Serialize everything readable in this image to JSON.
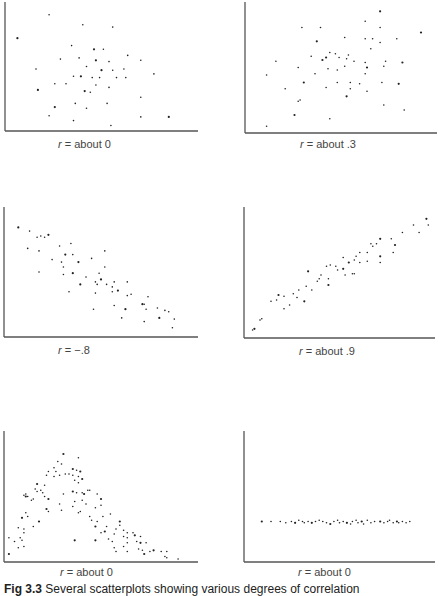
{
  "caption": {
    "fig_label": "Fig 3.3",
    "text": "Several scatterplots showing various degrees of correlation"
  },
  "chart_data": [
    {
      "type": "scatter",
      "id": "p1",
      "label_var": "r",
      "label_rest": " = about 0",
      "xlim": [
        0,
        100
      ],
      "ylim": [
        0,
        100
      ],
      "grid": false,
      "points": [
        [
          5,
          73
        ],
        [
          22,
          92
        ],
        [
          40,
          84
        ],
        [
          56,
          82
        ],
        [
          34,
          67
        ],
        [
          46,
          64
        ],
        [
          51,
          64
        ],
        [
          64,
          59
        ],
        [
          28,
          56
        ],
        [
          38,
          57
        ],
        [
          47,
          55
        ],
        [
          54,
          54
        ],
        [
          71,
          55
        ],
        [
          15,
          48
        ],
        [
          42,
          50
        ],
        [
          50,
          47
        ],
        [
          56,
          47
        ],
        [
          62,
          48
        ],
        [
          78,
          44
        ],
        [
          35,
          42
        ],
        [
          39,
          42
        ],
        [
          45,
          41
        ],
        [
          49,
          41
        ],
        [
          58,
          41
        ],
        [
          63,
          41
        ],
        [
          16,
          31
        ],
        [
          25,
          36
        ],
        [
          31,
          36
        ],
        [
          47,
          35
        ],
        [
          54,
          33
        ],
        [
          41,
          30
        ],
        [
          44,
          29
        ],
        [
          71,
          25
        ],
        [
          36,
          20
        ],
        [
          53,
          20
        ],
        [
          25,
          17
        ],
        [
          42,
          16
        ],
        [
          22,
          10
        ],
        [
          35,
          6
        ],
        [
          71,
          9
        ],
        [
          86,
          9
        ],
        [
          55,
          2
        ]
      ]
    },
    {
      "type": "scatter",
      "id": "p2",
      "label_var": "r",
      "label_rest": " = about .3",
      "xlim": [
        0,
        100
      ],
      "ylim": [
        0,
        100
      ],
      "grid": false,
      "points": [
        [
          71,
          95
        ],
        [
          63,
          87
        ],
        [
          29,
          82
        ],
        [
          39,
          82
        ],
        [
          71,
          82
        ],
        [
          93,
          78
        ],
        [
          52,
          74
        ],
        [
          63,
          73
        ],
        [
          67,
          73
        ],
        [
          80,
          73
        ],
        [
          37,
          71
        ],
        [
          71,
          70
        ],
        [
          66,
          65
        ],
        [
          54,
          60
        ],
        [
          34,
          59
        ],
        [
          42,
          58
        ],
        [
          44,
          62
        ],
        [
          47,
          61
        ],
        [
          49,
          58
        ],
        [
          15,
          55
        ],
        [
          40,
          56
        ],
        [
          53,
          57
        ],
        [
          57,
          55
        ],
        [
          63,
          54
        ],
        [
          74,
          55
        ],
        [
          83,
          54
        ],
        [
          27,
          50
        ],
        [
          43,
          49
        ],
        [
          48,
          48
        ],
        [
          52,
          51
        ],
        [
          64,
          50
        ],
        [
          73,
          51
        ],
        [
          10,
          44
        ],
        [
          36,
          45
        ],
        [
          63,
          45
        ],
        [
          30,
          38
        ],
        [
          48,
          38
        ],
        [
          55,
          38
        ],
        [
          60,
          37
        ],
        [
          72,
          38
        ],
        [
          81,
          37
        ],
        [
          20,
          33
        ],
        [
          42,
          34
        ],
        [
          55,
          33
        ],
        [
          64,
          31
        ],
        [
          53,
          27
        ],
        [
          27,
          23
        ],
        [
          28,
          24
        ],
        [
          73,
          20
        ],
        [
          84,
          16
        ],
        [
          25,
          12
        ],
        [
          44,
          9
        ],
        [
          10,
          3
        ]
      ]
    },
    {
      "type": "scatter",
      "id": "p3",
      "label_var": "r",
      "label_rest": " = −.8",
      "xlim": [
        0,
        100
      ],
      "ylim": [
        0,
        100
      ],
      "grid": false,
      "points": [
        [
          6,
          86
        ],
        [
          12,
          83
        ],
        [
          16,
          78
        ],
        [
          18,
          79
        ],
        [
          20,
          78
        ],
        [
          22,
          80
        ],
        [
          11,
          69
        ],
        [
          17,
          67
        ],
        [
          28,
          71
        ],
        [
          34,
          73
        ],
        [
          31,
          64
        ],
        [
          35,
          64
        ],
        [
          52,
          67
        ],
        [
          24,
          60
        ],
        [
          29,
          58
        ],
        [
          38,
          58
        ],
        [
          45,
          61
        ],
        [
          30,
          54
        ],
        [
          52,
          54
        ],
        [
          17,
          50
        ],
        [
          35,
          49
        ],
        [
          42,
          46
        ],
        [
          49,
          49
        ],
        [
          30,
          48
        ],
        [
          47,
          42
        ],
        [
          50,
          44
        ],
        [
          53,
          40
        ],
        [
          48,
          40
        ],
        [
          57,
          42
        ],
        [
          64,
          42
        ],
        [
          39,
          40
        ],
        [
          56,
          38
        ],
        [
          33,
          34
        ],
        [
          47,
          33
        ],
        [
          56,
          34
        ],
        [
          59,
          35
        ],
        [
          64,
          31
        ],
        [
          66,
          32
        ],
        [
          75,
          30
        ],
        [
          57,
          23
        ],
        [
          72,
          24
        ],
        [
          73,
          24
        ],
        [
          80,
          21
        ],
        [
          74,
          20
        ],
        [
          46,
          20
        ],
        [
          63,
          20
        ],
        [
          84,
          19
        ],
        [
          86,
          18
        ],
        [
          61,
          13
        ],
        [
          73,
          10
        ],
        [
          81,
          13
        ],
        [
          89,
          12
        ],
        [
          88,
          5
        ]
      ]
    },
    {
      "type": "scatter",
      "id": "p4",
      "label_var": "r",
      "label_rest": " = about .9",
      "xlim": [
        0,
        100
      ],
      "ylim": [
        0,
        100
      ],
      "grid": false,
      "points": [
        [
          97,
          93
        ],
        [
          98,
          88
        ],
        [
          90,
          88
        ],
        [
          84,
          82
        ],
        [
          93,
          82
        ],
        [
          72,
          77
        ],
        [
          78,
          77
        ],
        [
          67,
          73
        ],
        [
          70,
          73
        ],
        [
          68,
          71
        ],
        [
          80,
          72
        ],
        [
          61,
          66
        ],
        [
          65,
          66
        ],
        [
          79,
          66
        ],
        [
          59,
          63
        ],
        [
          72,
          63
        ],
        [
          52,
          62
        ],
        [
          58,
          60
        ],
        [
          65,
          59
        ],
        [
          61,
          58
        ],
        [
          55,
          58
        ],
        [
          72,
          58
        ],
        [
          45,
          56
        ],
        [
          48,
          55
        ],
        [
          43,
          55
        ],
        [
          52,
          53
        ],
        [
          49,
          52
        ],
        [
          57,
          49
        ],
        [
          58,
          49
        ],
        [
          53,
          48
        ],
        [
          33,
          51
        ],
        [
          40,
          48
        ],
        [
          44,
          45
        ],
        [
          39,
          45
        ],
        [
          38,
          43
        ],
        [
          44,
          40
        ],
        [
          32,
          39
        ],
        [
          35,
          36
        ],
        [
          28,
          36
        ],
        [
          25,
          33
        ],
        [
          17,
          32
        ],
        [
          20,
          31
        ],
        [
          27,
          30
        ],
        [
          16,
          28
        ],
        [
          13,
          27
        ],
        [
          31,
          27
        ],
        [
          23,
          24
        ],
        [
          20,
          21
        ],
        [
          8,
          13
        ],
        [
          7,
          12
        ],
        [
          4,
          5
        ],
        [
          3,
          4
        ]
      ]
    },
    {
      "type": "scatter",
      "id": "p5",
      "label_var": "r",
      "label_rest": " = about 0",
      "xlim": [
        0,
        100
      ],
      "ylim": [
        0,
        100
      ],
      "grid": false,
      "points": [
        [
          30,
          84
        ],
        [
          38,
          81
        ],
        [
          27,
          78
        ],
        [
          29,
          76
        ],
        [
          25,
          73
        ],
        [
          35,
          72
        ],
        [
          22,
          70
        ],
        [
          26,
          70
        ],
        [
          31,
          68
        ],
        [
          37,
          71
        ],
        [
          39,
          70
        ],
        [
          33,
          68
        ],
        [
          28,
          67
        ],
        [
          35,
          67
        ],
        [
          38,
          66
        ],
        [
          40,
          64
        ],
        [
          21,
          67
        ],
        [
          25,
          66
        ],
        [
          36,
          63
        ],
        [
          38,
          61
        ],
        [
          16,
          60
        ],
        [
          20,
          59
        ],
        [
          15,
          56
        ],
        [
          18,
          55
        ],
        [
          16,
          54
        ],
        [
          35,
          54
        ],
        [
          37,
          53
        ],
        [
          19,
          53
        ],
        [
          10,
          52
        ],
        [
          9,
          51
        ],
        [
          10,
          50
        ],
        [
          11,
          50
        ],
        [
          43,
          55
        ],
        [
          44,
          55
        ],
        [
          40,
          53
        ],
        [
          41,
          52
        ],
        [
          20,
          50
        ],
        [
          30,
          52
        ],
        [
          48,
          52
        ],
        [
          14,
          48
        ],
        [
          22,
          48
        ],
        [
          36,
          46
        ],
        [
          13,
          47
        ],
        [
          40,
          47
        ],
        [
          42,
          44
        ],
        [
          50,
          48
        ],
        [
          50,
          43
        ],
        [
          28,
          44
        ],
        [
          35,
          42
        ],
        [
          47,
          41
        ],
        [
          21,
          40
        ],
        [
          29,
          39
        ],
        [
          38,
          37
        ],
        [
          22,
          38
        ],
        [
          10,
          37
        ],
        [
          8,
          33
        ],
        [
          55,
          36
        ],
        [
          11,
          34
        ],
        [
          44,
          34
        ],
        [
          51,
          34
        ],
        [
          60,
          30
        ],
        [
          39,
          38
        ],
        [
          45,
          31
        ],
        [
          60,
          27
        ],
        [
          53,
          26
        ],
        [
          47,
          26
        ],
        [
          58,
          24
        ],
        [
          14,
          26
        ],
        [
          6,
          25
        ],
        [
          9,
          24
        ],
        [
          17,
          30
        ],
        [
          48,
          30
        ],
        [
          9,
          21
        ],
        [
          50,
          21
        ],
        [
          57,
          20
        ],
        [
          52,
          22
        ],
        [
          62,
          23
        ],
        [
          64,
          21
        ],
        [
          67,
          21
        ],
        [
          62,
          18
        ],
        [
          68,
          19
        ],
        [
          64,
          17
        ],
        [
          71,
          18
        ],
        [
          7,
          17
        ],
        [
          4,
          14
        ],
        [
          47,
          15
        ],
        [
          54,
          16
        ],
        [
          56,
          14
        ],
        [
          69,
          14
        ],
        [
          74,
          13
        ],
        [
          71,
          13
        ],
        [
          64,
          13
        ],
        [
          6,
          9
        ],
        [
          9,
          10
        ],
        [
          57,
          9
        ],
        [
          36,
          15
        ],
        [
          8,
          15
        ],
        [
          62,
          10
        ],
        [
          70,
          8
        ],
        [
          72,
          7
        ],
        [
          78,
          7
        ],
        [
          76,
          6
        ],
        [
          82,
          6
        ],
        [
          85,
          6
        ],
        [
          64,
          6
        ],
        [
          73,
          4
        ],
        [
          58,
          6
        ],
        [
          84,
          2
        ],
        [
          85,
          1
        ],
        [
          91,
          0
        ],
        [
          1,
          4
        ],
        [
          1,
          17
        ]
      ]
    },
    {
      "type": "scatter",
      "id": "p6",
      "label_var": "r",
      "label_rest": " = about 0",
      "xlim": [
        0,
        100
      ],
      "ylim": [
        0,
        100
      ],
      "grid": false,
      "points": [
        [
          8,
          30
        ],
        [
          13,
          30
        ],
        [
          18,
          30
        ],
        [
          21,
          29
        ],
        [
          24,
          30
        ],
        [
          26,
          29
        ],
        [
          28,
          31
        ],
        [
          30,
          30
        ],
        [
          31,
          29
        ],
        [
          33,
          30
        ],
        [
          35,
          29
        ],
        [
          37,
          30
        ],
        [
          39,
          31
        ],
        [
          41,
          30
        ],
        [
          43,
          29
        ],
        [
          45,
          28
        ],
        [
          47,
          30
        ],
        [
          49,
          31
        ],
        [
          50,
          29
        ],
        [
          52,
          30
        ],
        [
          54,
          29
        ],
        [
          56,
          28
        ],
        [
          57,
          30
        ],
        [
          59,
          31
        ],
        [
          60,
          29
        ],
        [
          62,
          30
        ],
        [
          63,
          28
        ],
        [
          65,
          31
        ],
        [
          67,
          29
        ],
        [
          69,
          30
        ],
        [
          72,
          30
        ],
        [
          74,
          29
        ],
        [
          76,
          30
        ],
        [
          77,
          31
        ],
        [
          79,
          29
        ],
        [
          81,
          30
        ],
        [
          82,
          29
        ],
        [
          84,
          30
        ],
        [
          86,
          29
        ],
        [
          88,
          30
        ]
      ]
    }
  ]
}
